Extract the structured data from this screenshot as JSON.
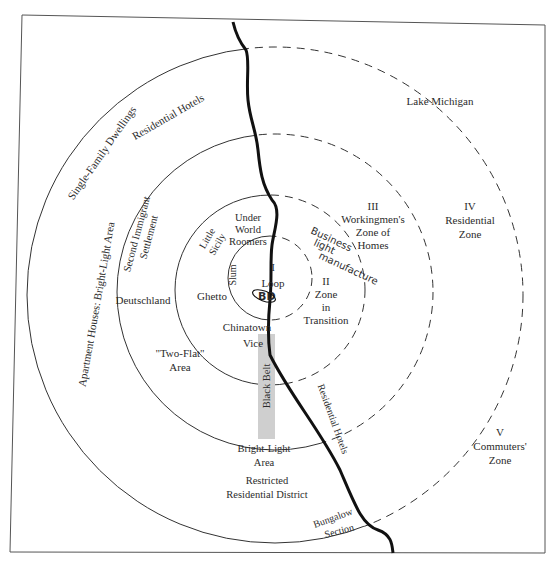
{
  "diagram": {
    "type": "concentric-zone-model",
    "zones": [
      {
        "numeral": "I",
        "name": "Loop",
        "label_lines": [
          "I",
          "Loop"
        ]
      },
      {
        "numeral": "II",
        "name": "Zone in Transition",
        "label_lines": [
          "II",
          "Zone",
          "in",
          "Transition"
        ]
      },
      {
        "numeral": "III",
        "name": "Workingmen's Zone of Homes",
        "label_lines": [
          "III",
          "Workingmen's",
          "Zone of",
          "Homes"
        ]
      },
      {
        "numeral": "IV",
        "name": "Residential Zone",
        "label_lines": [
          "IV",
          "Residential",
          "Zone"
        ]
      },
      {
        "numeral": "V",
        "name": "Commuters' Zone",
        "label_lines": [
          "V",
          "Commuters'",
          "Zone"
        ]
      }
    ],
    "labels": {
      "lake": "Lake Michigan",
      "single_family": "Single-Family Dwellings",
      "residential_hotels_top": "Residential Hotels",
      "apartment_houses": "Apartment Houses:  Bright-Light Area",
      "second_immigrant": [
        "Second Immigrant",
        "Settlement"
      ],
      "little_sicily": [
        "Little",
        "Sicily"
      ],
      "under_world": [
        "Under",
        "World",
        "Roomers"
      ],
      "slum": "Slum",
      "ghetto": "Ghetto",
      "deutschland": "Deutschland",
      "chinatown": "Chinatown",
      "vice": "Vice",
      "two_flat": [
        "\"Two-Flat\"",
        "Area"
      ],
      "black_belt": "Black Belt",
      "bright_light": [
        "Bright-Light",
        "Area"
      ],
      "restricted": [
        "Restricted",
        "Residential District"
      ],
      "residential_hotels_shore": "Residential Hotels",
      "bungalow": [
        "Bungalow",
        "Section"
      ]
    },
    "annotations": {
      "handwritten_note": [
        "Business",
        "light",
        "manufacture"
      ],
      "handwritten_loop_mark": "BD"
    },
    "colors": {
      "ink": "#2b2b2b",
      "shoreline": "#111111",
      "black_belt_fill": "#cfcfcf",
      "frame": "#555555"
    }
  }
}
